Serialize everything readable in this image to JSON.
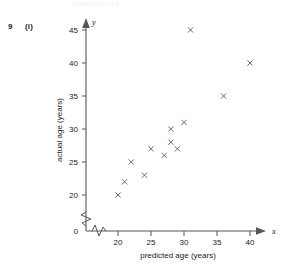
{
  "page": {
    "running_header": "9709/12/M/J/20",
    "question_number": "9",
    "question_part": "(i)"
  },
  "chart_data": {
    "type": "scatter",
    "title": "",
    "xlabel": "predicted age (years)",
    "ylabel": "actual age (years)",
    "x_axis_variable": "x",
    "y_axis_variable": "y",
    "origin_label": "0",
    "xlim": [
      17,
      42
    ],
    "ylim": [
      18.5,
      46
    ],
    "grid": false,
    "legend": null,
    "axis_break_x": true,
    "axis_break_y": true,
    "marker": "x",
    "marker_color": "#6a6a74",
    "xticks": [
      20,
      25,
      30,
      35,
      40
    ],
    "yticks": [
      20,
      25,
      30,
      35,
      40,
      45
    ],
    "xticklabels": [
      "20",
      "25",
      "30",
      "35",
      "40"
    ],
    "yticklabels": [
      "20",
      "25",
      "30",
      "35",
      "40",
      "45"
    ],
    "points": [
      {
        "x": 20,
        "y": 20
      },
      {
        "x": 21,
        "y": 22
      },
      {
        "x": 22,
        "y": 25
      },
      {
        "x": 24,
        "y": 23
      },
      {
        "x": 25,
        "y": 27
      },
      {
        "x": 27,
        "y": 26
      },
      {
        "x": 28,
        "y": 30
      },
      {
        "x": 28,
        "y": 28
      },
      {
        "x": 29,
        "y": 27
      },
      {
        "x": 30,
        "y": 31
      },
      {
        "x": 31,
        "y": 45
      },
      {
        "x": 36,
        "y": 35
      },
      {
        "x": 40,
        "y": 40
      }
    ],
    "n_points": 13
  }
}
